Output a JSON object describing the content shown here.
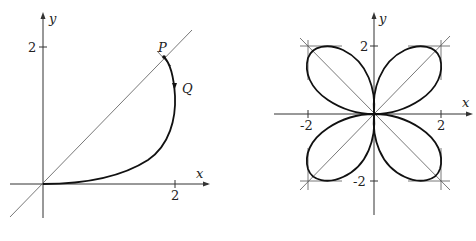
{
  "left_plot": {
    "x_axis_label": "x",
    "y_axis_label": "y",
    "x_tick_label": "2",
    "y_tick_label": "2",
    "point_p_label": "P",
    "point_q_label": "Q",
    "line": "y = x",
    "curve_description": "Curve from origin rising to point P on the line y = x, passing through Q on the right side, with a direction arrow near Q"
  },
  "right_plot": {
    "x_axis_label": "x",
    "y_axis_label": "y",
    "x_tick_labels": [
      "-2",
      "2"
    ],
    "y_tick_labels": [
      "2",
      "-2"
    ],
    "curve_description": "Four-petal curve with petals along the diagonals y = x and y = -x, each bounded by horizontal and vertical tangent lines near (±2, ±2)"
  },
  "colors": {
    "ink": "#111111",
    "thin_line": "#555555",
    "background": "#ffffff"
  }
}
